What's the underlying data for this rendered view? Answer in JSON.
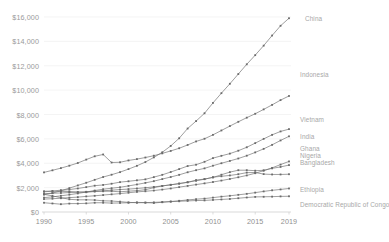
{
  "chart_data": {
    "type": "line",
    "title": "",
    "subtitle": "",
    "xlabel": "",
    "ylabel": "",
    "xlim": [
      1990,
      2019
    ],
    "ylim": [
      0,
      16000
    ],
    "grid": true,
    "legend_position": "right-inline",
    "y_ticks": [
      "$0",
      "$2,000",
      "$4,000",
      "$6,000",
      "$8,000",
      "$10,000",
      "$12,000",
      "$14,000",
      "$16,000"
    ],
    "y_tick_values": [
      0,
      2000,
      4000,
      6000,
      8000,
      10000,
      12000,
      14000,
      16000
    ],
    "x_ticks": [
      "1990",
      "1995",
      "2000",
      "2005",
      "2010",
      "2015",
      "2019"
    ],
    "x_tick_values": [
      1990,
      1995,
      2000,
      2005,
      2010,
      2015,
      2019
    ],
    "x": [
      1990,
      1991,
      1992,
      1993,
      1994,
      1995,
      1996,
      1997,
      1998,
      1999,
      2000,
      2001,
      2002,
      2003,
      2004,
      2005,
      2006,
      2007,
      2008,
      2009,
      2010,
      2011,
      2012,
      2013,
      2014,
      2015,
      2016,
      2017,
      2018,
      2019
    ],
    "series": [
      {
        "name": "China",
        "color": "#6b6b6b",
        "values": [
          1430,
          1550,
          1740,
          1960,
          2180,
          2400,
          2640,
          2870,
          3060,
          3270,
          3520,
          3790,
          4100,
          4480,
          4900,
          5420,
          6050,
          6850,
          7460,
          8100,
          8950,
          9750,
          10520,
          11320,
          12120,
          12870,
          13650,
          14480,
          15280,
          15900
        ],
        "label_x": 305,
        "label_y": 15
      },
      {
        "name": "Indonesia",
        "color": "#6b6b6b",
        "values": [
          3250,
          3420,
          3600,
          3800,
          4020,
          4300,
          4570,
          4720,
          4060,
          4080,
          4230,
          4340,
          4470,
          4620,
          4810,
          5010,
          5230,
          5500,
          5790,
          6010,
          6330,
          6690,
          7050,
          7400,
          7740,
          8060,
          8420,
          8790,
          9180,
          9520
        ],
        "label_x": 300,
        "label_y": 71
      },
      {
        "name": "Vietnam",
        "color": "#6b6b6b",
        "values": [
          1180,
          1240,
          1330,
          1420,
          1520,
          1640,
          1760,
          1870,
          1950,
          2030,
          2140,
          2260,
          2390,
          2530,
          2700,
          2870,
          3050,
          3260,
          3430,
          3580,
          3800,
          4000,
          4190,
          4390,
          4620,
          4890,
          5180,
          5510,
          5870,
          6210
        ],
        "label_x": 300,
        "label_y": 116
      },
      {
        "name": "India",
        "color": "#6b6b6b",
        "values": [
          1700,
          1720,
          1790,
          1840,
          1930,
          2040,
          2160,
          2220,
          2320,
          2450,
          2520,
          2600,
          2680,
          2860,
          3050,
          3280,
          3520,
          3770,
          3880,
          4120,
          4420,
          4610,
          4790,
          5030,
          5310,
          5650,
          6000,
          6330,
          6610,
          6800
        ],
        "label_x": 300,
        "label_y": 133
      },
      {
        "name": "Ghana",
        "color": "#6b6b6b",
        "values": [
          1500,
          1540,
          1560,
          1600,
          1620,
          1660,
          1700,
          1740,
          1790,
          1840,
          1880,
          1930,
          1990,
          2060,
          2140,
          2230,
          2330,
          2430,
          2620,
          2700,
          2830,
          3060,
          3270,
          3430,
          3430,
          3390,
          3420,
          3580,
          3700,
          3850
        ],
        "label_x": 300,
        "label_y": 145
      },
      {
        "name": "Nigeria",
        "color": "#6b6b6b",
        "values": [
          1660,
          1700,
          1690,
          1680,
          1640,
          1620,
          1680,
          1700,
          1700,
          1660,
          1710,
          1750,
          1830,
          2000,
          2140,
          2230,
          2330,
          2450,
          2560,
          2690,
          2860,
          2930,
          3000,
          3100,
          3230,
          3240,
          3110,
          3080,
          3080,
          3100
        ],
        "label_x": 300,
        "label_y": 152
      },
      {
        "name": "Bangladesh",
        "color": "#6b6b6b",
        "values": [
          1060,
          1090,
          1130,
          1180,
          1220,
          1280,
          1330,
          1390,
          1450,
          1510,
          1580,
          1650,
          1700,
          1760,
          1840,
          1930,
          2040,
          2140,
          2250,
          2350,
          2460,
          2580,
          2710,
          2850,
          3000,
          3180,
          3390,
          3620,
          3890,
          4150
        ],
        "label_x": 300,
        "label_y": 159
      },
      {
        "name": "Ethiopia",
        "color": "#6b6b6b",
        "values": [
          760,
          700,
          640,
          690,
          690,
          710,
          760,
          760,
          730,
          740,
          760,
          790,
          770,
          740,
          800,
          860,
          920,
          990,
          1050,
          1100,
          1180,
          1260,
          1330,
          1410,
          1490,
          1590,
          1690,
          1780,
          1850,
          1930
        ],
        "label_x": 300,
        "label_y": 186
      },
      {
        "name": "Democratic Republic of Congo",
        "color": "#6b6b6b",
        "values": [
          1450,
          1320,
          1180,
          1040,
          1000,
          1000,
          980,
          920,
          900,
          850,
          790,
          760,
          770,
          790,
          820,
          850,
          880,
          910,
          940,
          950,
          990,
          1030,
          1070,
          1130,
          1190,
          1240,
          1250,
          1260,
          1280,
          1290
        ],
        "label_x": 300,
        "label_y": 201
      }
    ]
  },
  "axis": {
    "y_axis_name": "y-axis",
    "x_axis_name": "x-axis"
  }
}
